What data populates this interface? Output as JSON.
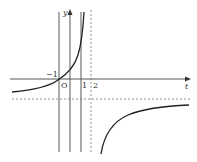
{
  "figure": {
    "type": "function-graph",
    "axes": {
      "x_label": "t",
      "y_label": "y",
      "origin_label": "O"
    },
    "tick_labels": {
      "x_neg1": "−1",
      "x_1": "1",
      "x_2": "2"
    },
    "asymptotes": {
      "vertical_dashed": "t = 2",
      "horizontal_dashed": "y = negative constant"
    },
    "vertical_lines": [
      "t = −1",
      "t = 0 (y-axis)",
      "t = 1"
    ],
    "curves": [
      "left branch: increasing from near horizontal asymptote, crossing origin, rising steeply toward t = 2",
      "right branch: rising from −∞ just right of t = 2, approaching horizontal asymptote from below"
    ],
    "colors": {
      "line": "#333333",
      "background": "#ffffff"
    }
  }
}
